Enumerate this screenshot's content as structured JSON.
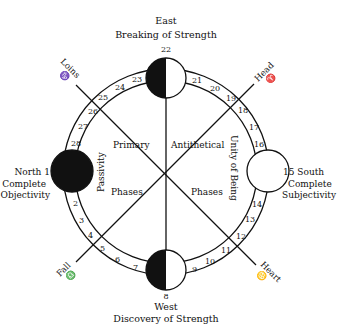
{
  "title": {
    "east_heading": "East",
    "east_sub": "Breaking of Strength",
    "west_heading": "West",
    "west_sub": "Discovery of Strength"
  },
  "cardinals": {
    "east_number": "22",
    "west_number": "8",
    "north_label": "North 1",
    "north_line2": "Complete",
    "north_line3": "Objectivity",
    "south_label": "15 South",
    "south_line2": "Complete",
    "south_line3": "Subjectivity"
  },
  "diagonals": {
    "loins": "Loins",
    "loins_sign": "♑",
    "head": "Head",
    "head_sign": "♈",
    "fall": "Fall",
    "fall_sign": "♎",
    "heart": "Heart",
    "heart_sign": "♋"
  },
  "inner_labels": {
    "primary": "Primary",
    "antithetical": "Antithetical",
    "phases_left": "Phases",
    "phases_right": "Phases",
    "passivity": "Passivity",
    "unity_of_being": "Unity of Being"
  },
  "phases": {
    "n2": "2",
    "n3": "3",
    "n4": "4",
    "n5": "5",
    "n6": "6",
    "n7": "7",
    "n9": "9",
    "n10": "10",
    "n11": "11",
    "n12": "12",
    "n13": "13",
    "n14": "14",
    "n16": "16",
    "n17": "17",
    "n18": "18",
    "n19": "19",
    "n20": "20",
    "n21": "21",
    "n23": "23",
    "n24": "24",
    "n25": "25",
    "n26": "26",
    "n27": "27",
    "n28": "28"
  },
  "colors": {
    "ink": "#111111",
    "paper": "#ffffff"
  }
}
